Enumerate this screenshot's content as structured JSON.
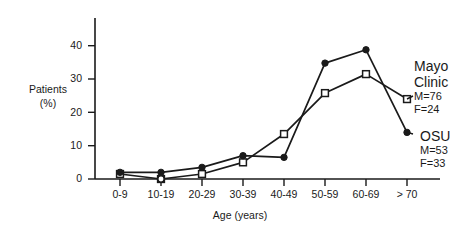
{
  "chart_data": {
    "type": "line",
    "title": "",
    "xlabel": "Age (years)",
    "ylabel": "Patients (%)",
    "ylabel_line1": "Patients",
    "ylabel_line2": "(%)",
    "categories": [
      "0-9",
      "10-19",
      "20-29",
      "30-39",
      "40-49",
      "50-59",
      "60-69",
      "> 70"
    ],
    "ylim": [
      0,
      45
    ],
    "yticks": [
      0,
      10,
      20,
      30,
      40
    ],
    "ytick_labels": [
      "0",
      "10",
      "20",
      "30",
      "40"
    ],
    "grid": false,
    "legend_position": "right",
    "series": [
      {
        "name": "Mayo Clinic",
        "marker": "open-square",
        "color": "#1a1a1a",
        "values": [
          1.5,
          0,
          1.5,
          5,
          13.5,
          25.8,
          31.5,
          24
        ]
      },
      {
        "name": "OSU",
        "marker": "filled-circle",
        "color": "#1a1a1a",
        "values": [
          2,
          2,
          3.5,
          7,
          6.5,
          34.8,
          38.8,
          14
        ]
      }
    ],
    "annotations": [
      {
        "series": "Mayo Clinic",
        "name_line1": "Mayo",
        "name_line2": "Clinic",
        "stat_male": "M=76",
        "stat_female": "F=24"
      },
      {
        "series": "OSU",
        "name_line1": "OSU",
        "name_line2": "",
        "stat_male": "M=53",
        "stat_female": "F=33"
      }
    ]
  }
}
